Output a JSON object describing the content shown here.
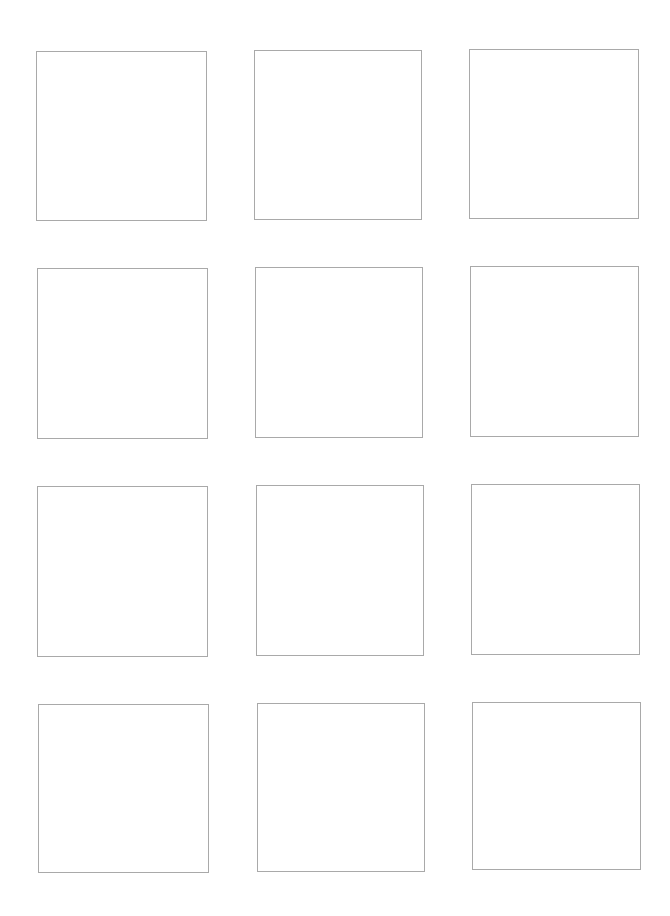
{
  "page": {
    "rows": 4,
    "columns": 3,
    "border_color": "#a9a9a9",
    "background_color": "#ffffff"
  },
  "boxes": [
    {
      "row": 1,
      "col": 1,
      "x": 36,
      "y": 51,
      "w": 171,
      "h": 170
    },
    {
      "row": 1,
      "col": 2,
      "x": 254,
      "y": 50,
      "w": 168,
      "h": 170
    },
    {
      "row": 1,
      "col": 3,
      "x": 469,
      "y": 49,
      "w": 170,
      "h": 170
    },
    {
      "row": 2,
      "col": 1,
      "x": 37,
      "y": 268,
      "w": 171,
      "h": 171
    },
    {
      "row": 2,
      "col": 2,
      "x": 255,
      "y": 267,
      "w": 168,
      "h": 171
    },
    {
      "row": 2,
      "col": 3,
      "x": 470,
      "y": 266,
      "w": 169,
      "h": 171
    },
    {
      "row": 3,
      "col": 1,
      "x": 37,
      "y": 486,
      "w": 171,
      "h": 171
    },
    {
      "row": 3,
      "col": 2,
      "x": 256,
      "y": 485,
      "w": 168,
      "h": 171
    },
    {
      "row": 3,
      "col": 3,
      "x": 471,
      "y": 484,
      "w": 169,
      "h": 171
    },
    {
      "row": 4,
      "col": 1,
      "x": 38,
      "y": 704,
      "w": 171,
      "h": 169
    },
    {
      "row": 4,
      "col": 2,
      "x": 257,
      "y": 703,
      "w": 168,
      "h": 169
    },
    {
      "row": 4,
      "col": 3,
      "x": 472,
      "y": 702,
      "w": 169,
      "h": 168
    }
  ]
}
